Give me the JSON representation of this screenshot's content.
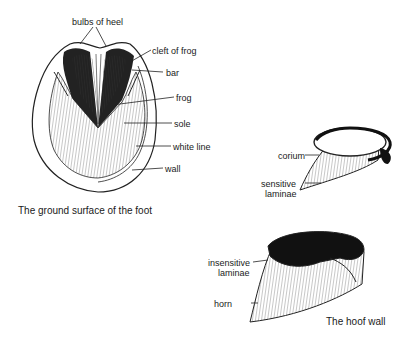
{
  "figures": [
    {
      "caption": "The ground surface of the foot",
      "labels": {
        "bulbs_of_heel": "bulbs of heel",
        "cleft_of_frog": "cleft of frog",
        "bar": "bar",
        "frog": "frog",
        "sole": "sole",
        "white_line": "white line",
        "wall": "wall"
      }
    },
    {
      "caption": "The hoof wall",
      "labels": {
        "corium": "corium",
        "sensitive_laminae_1": "sensitive",
        "sensitive_laminae_2": "laminae",
        "insensitive_laminae_1": "insensitive",
        "insensitive_laminae_2": "laminae",
        "horn": "horn"
      }
    }
  ]
}
